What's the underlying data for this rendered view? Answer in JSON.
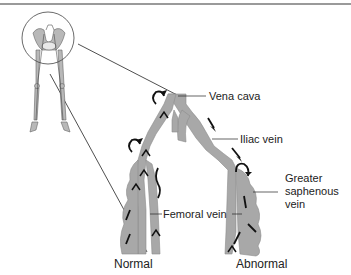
{
  "diagram": {
    "labels": {
      "vena_cava": "Vena cava",
      "iliac_vein": "Iliac vein",
      "greater_saphenous_line1": "Greater",
      "greater_saphenous_line2": "saphenous",
      "greater_saphenous_line3": "vein",
      "femoral_vein": "Femoral vein",
      "normal": "Normal",
      "abnormal": "Abnormal"
    },
    "colors": {
      "vein_fill": "#a8a8a8",
      "vein_stroke": "#8a8a8a",
      "arrow": "#111111",
      "line": "#222222",
      "top_rule": "#9a9a9a"
    }
  }
}
